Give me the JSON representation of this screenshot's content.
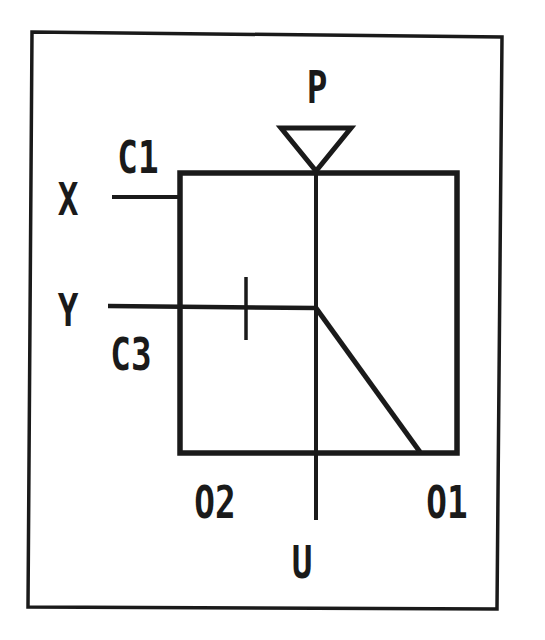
{
  "diagram": {
    "type": "hydraulic-valve-symbol",
    "stroke_color": "#1a1a1a",
    "background_color": "#ffffff",
    "labels": {
      "P": "P",
      "C1": "C1",
      "X": "X",
      "Y": "Y",
      "C3": "C3",
      "O2": "O2",
      "O1": "O1",
      "U": "U"
    },
    "ports": [
      {
        "id": "P",
        "position": "top",
        "symbol": "inverted-triangle"
      },
      {
        "id": "X",
        "position": "left-upper"
      },
      {
        "id": "Y",
        "position": "left-lower"
      },
      {
        "id": "U",
        "position": "bottom"
      }
    ],
    "connections": [
      {
        "id": "C1",
        "label": "C1"
      },
      {
        "id": "C3",
        "label": "C3"
      },
      {
        "id": "O1",
        "label": "O1"
      },
      {
        "id": "O2",
        "label": "O2"
      }
    ]
  }
}
